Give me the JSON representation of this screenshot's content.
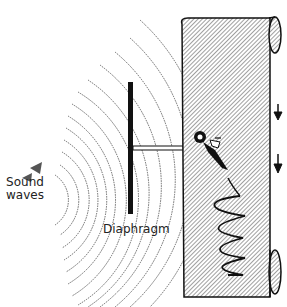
{
  "diagram": {
    "title": "",
    "labels": {
      "sound_line1": "Sound",
      "sound_line2": "waves",
      "diaphragm": "Diaphragm"
    },
    "elements": [
      {
        "name": "sound-waves",
        "description": "concentric dotted arcs radiating from left toward diaphragm"
      },
      {
        "name": "diaphragm",
        "description": "vertical dark bar"
      },
      {
        "name": "stylus-rod",
        "description": "horizontal rod connecting diaphragm to stylus"
      },
      {
        "name": "stylus",
        "description": "pen/needle tracing on paper"
      },
      {
        "name": "paper-scroll",
        "description": "hatched paper strip with rolls at top and bottom"
      },
      {
        "name": "waveform-trace",
        "description": "zigzag line traced on paper"
      },
      {
        "name": "motion-arrows",
        "description": "two downward arrows showing paper movement"
      }
    ],
    "colors": {
      "ink": "#111111",
      "hatch": "#8a8a8a",
      "background": "#ffffff"
    }
  }
}
